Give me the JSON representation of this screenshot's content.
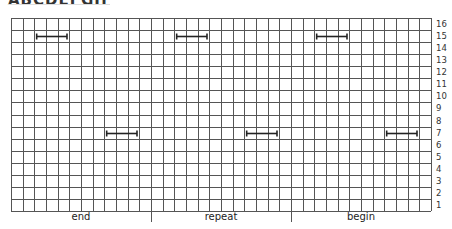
{
  "header": {
    "title_cropped": "ABCDEFGH"
  },
  "grid": {
    "columns": 36,
    "rows": 16,
    "row_numbers": [
      "16",
      "15",
      "14",
      "13",
      "12",
      "11",
      "10",
      "9",
      "8",
      "7",
      "6",
      "5",
      "4",
      "3",
      "2",
      "1"
    ],
    "line_color": "#555555"
  },
  "sections": [
    {
      "label": "end",
      "col_start": 0,
      "col_end": 12
    },
    {
      "label": "repeat",
      "col_start": 12,
      "col_end": 24
    },
    {
      "label": "begin",
      "col_start": 24,
      "col_end": 36
    }
  ],
  "stitches": [
    {
      "row": 15,
      "col_start": 2.2,
      "col_end": 4.8
    },
    {
      "row": 7,
      "col_start": 8.2,
      "col_end": 10.8
    },
    {
      "row": 15,
      "col_start": 14.2,
      "col_end": 16.8
    },
    {
      "row": 7,
      "col_start": 20.2,
      "col_end": 22.8
    },
    {
      "row": 15,
      "col_start": 26.2,
      "col_end": 28.8
    },
    {
      "row": 7,
      "col_start": 32.2,
      "col_end": 34.8
    }
  ]
}
